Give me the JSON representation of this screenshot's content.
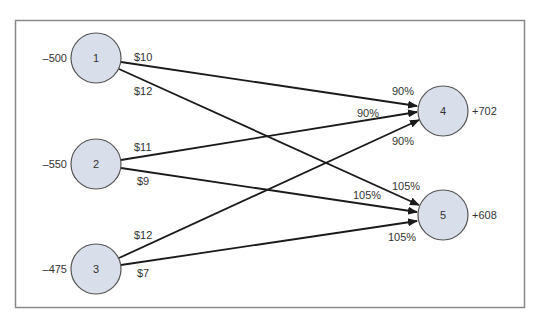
{
  "colors": {
    "node_fill": "#d8dfea",
    "node_stroke": "#555555",
    "edge": "#1a1a1a",
    "frame": "#888888",
    "text": "#333333"
  },
  "nodes": [
    {
      "id": "1",
      "label": "1",
      "supply": "–500",
      "cx": 96,
      "cy": 58,
      "side": "left"
    },
    {
      "id": "2",
      "label": "2",
      "supply": "–550",
      "cx": 96,
      "cy": 164,
      "side": "left"
    },
    {
      "id": "3",
      "label": "3",
      "supply": "–475",
      "cx": 96,
      "cy": 269,
      "side": "left"
    },
    {
      "id": "4",
      "label": "4",
      "supply": "+702",
      "cx": 443,
      "cy": 111,
      "side": "right"
    },
    {
      "id": "5",
      "label": "5",
      "supply": "+608",
      "cx": 443,
      "cy": 215,
      "side": "right"
    }
  ],
  "edges": [
    {
      "from": "1",
      "to": "4",
      "cost": "$10",
      "gain": "90%"
    },
    {
      "from": "1",
      "to": "5",
      "cost": "$12",
      "gain": "105%"
    },
    {
      "from": "2",
      "to": "4",
      "cost": "$11",
      "gain": "90%"
    },
    {
      "from": "2",
      "to": "5",
      "cost": "$9",
      "gain": "105%"
    },
    {
      "from": "3",
      "to": "4",
      "cost": "$12",
      "gain": "90%"
    },
    {
      "from": "3",
      "to": "5",
      "cost": "$7",
      "gain": "105%"
    }
  ],
  "labels": {
    "cost_1_4": "$10",
    "cost_1_5": "$12",
    "cost_2_4": "$11",
    "cost_2_5": "$9",
    "cost_3_4": "$12",
    "cost_3_5": "$7",
    "gain_1_4": "90%",
    "gain_2_4": "90%",
    "gain_3_4": "90%",
    "gain_1_5": "105%",
    "gain_2_5": "105%",
    "gain_3_5": "105%",
    "supply_1": "–500",
    "supply_2": "–550",
    "supply_3": "–475",
    "demand_4": "+702",
    "demand_5": "+608",
    "node_1": "1",
    "node_2": "2",
    "node_3": "3",
    "node_4": "4",
    "node_5": "5"
  }
}
